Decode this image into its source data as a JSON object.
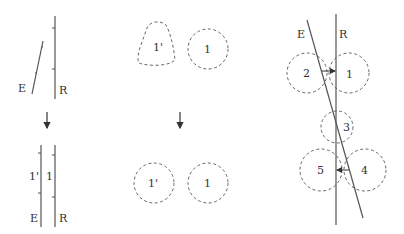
{
  "colors": {
    "line": "#555555",
    "dashed": "#666666",
    "text": "#333333",
    "background": "#ffffff"
  },
  "panel_left": {
    "top": {
      "label_E": "E",
      "label_R": "R"
    },
    "bottom": {
      "label_E": "E",
      "label_R": "R",
      "label_1prime": "1'",
      "label_1": "1"
    }
  },
  "panel_middle": {
    "top": {
      "label_1prime": "1'",
      "label_1": "1"
    },
    "bottom": {
      "label_1prime": "1'",
      "label_1": "1"
    }
  },
  "panel_right": {
    "label_E": "E",
    "label_R": "R",
    "circles": [
      "1",
      "2",
      "3",
      "4",
      "5"
    ]
  },
  "arrows": [
    "down-arrow-left",
    "down-arrow-middle"
  ]
}
